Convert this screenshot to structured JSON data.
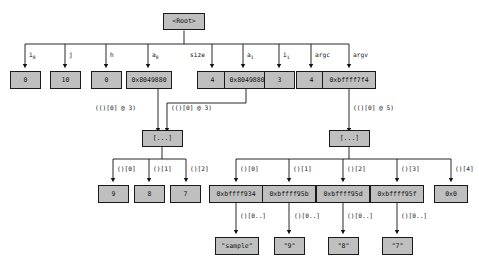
{
  "diagram": {
    "title": "Root",
    "root": {
      "label": "<Root>"
    },
    "frame_edges": [
      {
        "name": "i0",
        "label": "i",
        "sub": "0"
      },
      {
        "name": "j",
        "label": "j",
        "sub": ""
      },
      {
        "name": "h",
        "label": "h",
        "sub": ""
      },
      {
        "name": "a0",
        "label": "a",
        "sub": "0"
      },
      {
        "name": "size",
        "label": "size",
        "sub": ""
      },
      {
        "name": "a1",
        "label": "a",
        "sub": "1"
      },
      {
        "name": "i1",
        "label": "i",
        "sub": "1"
      },
      {
        "name": "argc",
        "label": "argc",
        "sub": ""
      },
      {
        "name": "argv",
        "label": "argv",
        "sub": ""
      }
    ],
    "frame_values": [
      {
        "name": "i0",
        "value": "0"
      },
      {
        "name": "j",
        "value": "10"
      },
      {
        "name": "h",
        "value": "0"
      },
      {
        "name": "a0",
        "value": "0x8049880"
      },
      {
        "name": "size",
        "value": "4"
      },
      {
        "name": "a1",
        "value": "0x8049880"
      },
      {
        "name": "i1",
        "value": "3"
      },
      {
        "name": "argc",
        "value": "4"
      },
      {
        "name": "argv",
        "value": "0xbffff7f4"
      }
    ],
    "deref_labels": {
      "a0_deref": "(()[0] @ 3)",
      "a1_deref": "(()[0] @ 3)",
      "argv_deref": "(()[0] @ 5)"
    },
    "int_array": {
      "node_label": "[...]",
      "index_labels": [
        "()[0]",
        "()[1]",
        "()[2]"
      ],
      "values": [
        "9",
        "8",
        "7"
      ]
    },
    "argv_array": {
      "node_label": "[...]",
      "index_labels": [
        "()[0]",
        "()[1]",
        "()[2]",
        "()[3]",
        "()[4]"
      ],
      "values": [
        "0xbffff934",
        "0xbffff95b",
        "0xbffff95d",
        "0xbffff95f",
        "0x0"
      ]
    },
    "strings": {
      "index_labels": [
        "()[0..]",
        "()[0..]",
        "()[0..]",
        "()[0..]"
      ],
      "values": [
        "\"sample\"",
        "\"9\"",
        "\"8\"",
        "\"7\""
      ]
    },
    "colors": {
      "node_fill": "#bfbfbf",
      "node_border": "#1a1a1a",
      "wire": "#111111",
      "background": "#ffffff"
    }
  }
}
